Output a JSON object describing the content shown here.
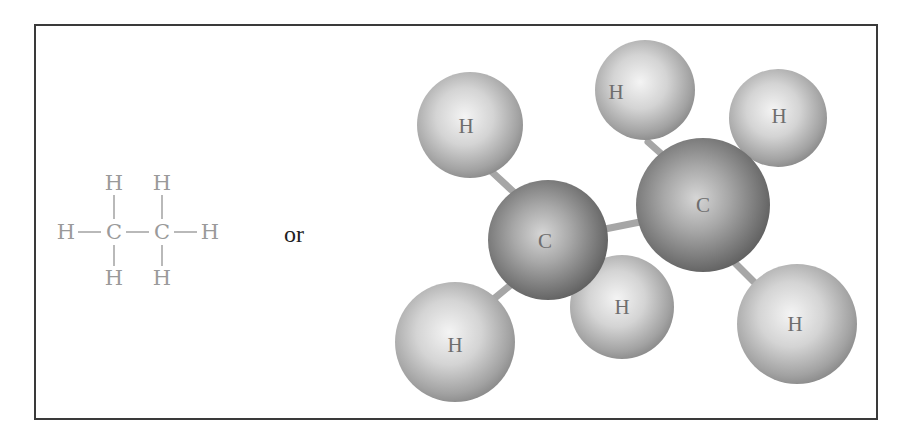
{
  "figure": {
    "connector_text": "or"
  },
  "structural_formula": {
    "color": "#9a9a9a",
    "atoms": [
      {
        "id": "h_top_1",
        "symbol": "H",
        "x": 114,
        "y": 183
      },
      {
        "id": "h_top_2",
        "symbol": "H",
        "x": 162,
        "y": 183
      },
      {
        "id": "h_left",
        "symbol": "H",
        "x": 66,
        "y": 232
      },
      {
        "id": "c1",
        "symbol": "C",
        "x": 114,
        "y": 232
      },
      {
        "id": "c2",
        "symbol": "C",
        "x": 162,
        "y": 232
      },
      {
        "id": "h_right",
        "symbol": "H",
        "x": 210,
        "y": 232
      },
      {
        "id": "h_bot_1",
        "symbol": "H",
        "x": 114,
        "y": 278
      },
      {
        "id": "h_bot_2",
        "symbol": "H",
        "x": 162,
        "y": 278
      }
    ]
  },
  "ball_and_stick": {
    "sphere_color_light": "#f2f2f2",
    "sphere_color_dark": "#7d7d7d",
    "carbon_color_light": "#d0d0d0",
    "carbon_color_dark": "#5e5e5e",
    "atoms": [
      {
        "id": "h1",
        "symbol": "H",
        "cx": 470,
        "cy": 125,
        "r": 53
      },
      {
        "id": "h2",
        "symbol": "H",
        "cx": 645,
        "cy": 90,
        "r": 50
      },
      {
        "id": "h3",
        "symbol": "H",
        "cx": 778,
        "cy": 118,
        "r": 49
      },
      {
        "id": "c1",
        "symbol": "C",
        "cx": 548,
        "cy": 240,
        "r": 60
      },
      {
        "id": "c2",
        "symbol": "C",
        "cx": 703,
        "cy": 205,
        "r": 67
      },
      {
        "id": "h4",
        "symbol": "H",
        "cx": 455,
        "cy": 342,
        "r": 60
      },
      {
        "id": "h5",
        "symbol": "H",
        "cx": 622,
        "cy": 307,
        "r": 52
      },
      {
        "id": "h6",
        "symbol": "H",
        "cx": 797,
        "cy": 324,
        "r": 60
      }
    ]
  }
}
